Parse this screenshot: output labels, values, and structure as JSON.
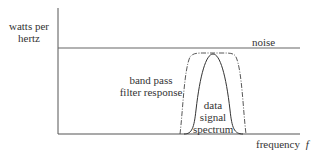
{
  "diagram": {
    "y_axis_label_line1": "watts per",
    "y_axis_label_line2": "hertz",
    "x_axis_label": "frequency",
    "x_axis_symbol": "f",
    "noise_label": "noise",
    "filter_label_line1": "band pass",
    "filter_label_line2": "filter response",
    "signal_label_line1": "data",
    "signal_label_line2": "signal",
    "signal_label_line3": "spectrum",
    "colors": {
      "axis": "#555555",
      "noise": "#666666",
      "filter": "#444444",
      "signal": "#333333",
      "text": "#333333"
    }
  }
}
